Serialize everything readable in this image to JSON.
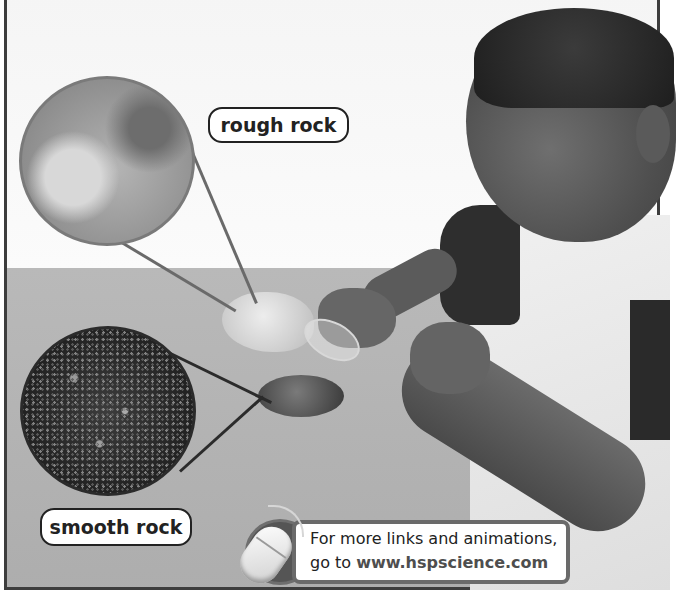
{
  "scene": {
    "description": "Boy examining rocks with a magnifying lens on a table",
    "colors": {
      "frame": "#3d3d3d",
      "wall": "#f7f7f7",
      "table": "#b3b3b3",
      "banner_border": "#6a6a6a"
    }
  },
  "callouts": {
    "rough": {
      "label": "rough rock",
      "icon": "magnified-rough-texture"
    },
    "smooth": {
      "label": "smooth rock",
      "icon": "magnified-smooth-texture"
    }
  },
  "banner": {
    "icon": "computer-mouse-icon",
    "line1": "For more links and animations,",
    "line2_prefix": "go to ",
    "url": "www.hspscience.com"
  }
}
